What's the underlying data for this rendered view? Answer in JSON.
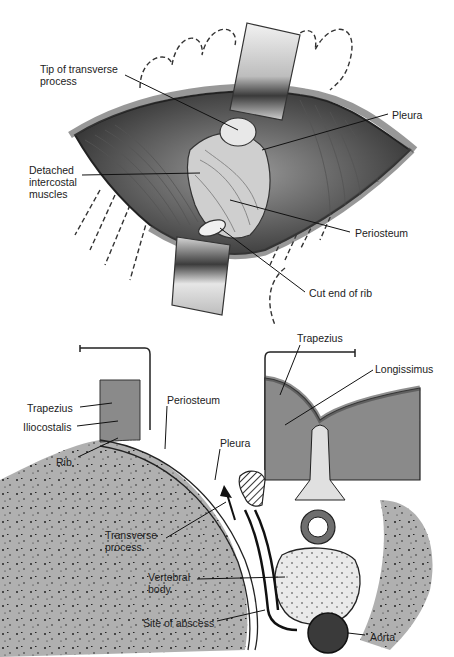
{
  "top_figure": {
    "title": "Surgical exposure (costotransversectomy view)",
    "labels": [
      {
        "id": "tip-transverse-process",
        "text": "Tip of transverse\nprocess",
        "x": 40,
        "y": 63
      },
      {
        "id": "pleura",
        "text": "Pleura",
        "x": 392,
        "y": 109
      },
      {
        "id": "detached-intercostal-muscles",
        "text": "Detached\nintercostal\nmuscles",
        "x": 29,
        "y": 164
      },
      {
        "id": "periosteum",
        "text": "Periosteum",
        "x": 355,
        "y": 227
      },
      {
        "id": "cut-end-of-rib",
        "text": "Cut end of rib",
        "x": 309,
        "y": 287
      }
    ]
  },
  "bottom_figure": {
    "title": "Cross-section of thoracic spine",
    "labels": [
      {
        "id": "trapezius-left",
        "text": "Trapezius",
        "x": 27,
        "y": 402
      },
      {
        "id": "iliocostalis",
        "text": "Iliocostalis",
        "x": 23,
        "y": 421
      },
      {
        "id": "rib",
        "text": "Rib",
        "x": 56,
        "y": 456
      },
      {
        "id": "periosteum",
        "text": "Periosteum",
        "x": 167,
        "y": 394
      },
      {
        "id": "pleura",
        "text": "Pleura",
        "x": 220,
        "y": 437
      },
      {
        "id": "trapezius-right",
        "text": "Trapezius",
        "x": 297,
        "y": 332
      },
      {
        "id": "longissimus",
        "text": "Longissimus",
        "x": 375,
        "y": 363
      },
      {
        "id": "transverse-process",
        "text": "Transverse\nprocess",
        "x": 105,
        "y": 529
      },
      {
        "id": "vertebral-body",
        "text": "Vertebral\nbody",
        "x": 148,
        "y": 571
      },
      {
        "id": "site-of-abscess",
        "text": "Site of abscess",
        "x": 143,
        "y": 617
      },
      {
        "id": "aorta",
        "text": "Aorta",
        "x": 370,
        "y": 631
      }
    ]
  },
  "colors": {
    "muscle": "#8a8a8a",
    "bone": "#b5b5b5",
    "bone_dark": "#6e6e6e",
    "fat": "#d8d8d8",
    "aorta": "#3a3a3a",
    "line": "#111111"
  }
}
